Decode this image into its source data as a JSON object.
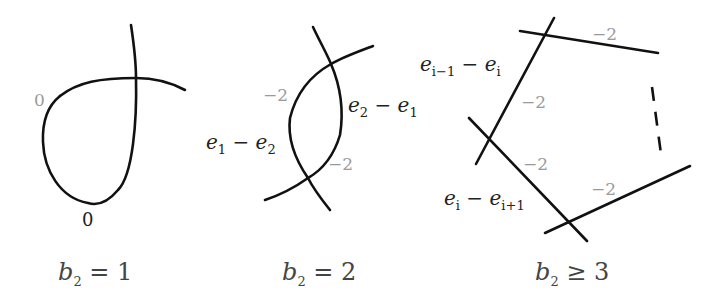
{
  "figure": {
    "panels": [
      {
        "id": "b2-eq-1",
        "caption": {
          "var": "b",
          "sub": "2",
          "rel": " = ",
          "val": "1"
        },
        "labels": [
          {
            "text": "0",
            "tone": "grey"
          },
          {
            "text": "0",
            "tone": "black"
          }
        ]
      },
      {
        "id": "b2-eq-2",
        "caption": {
          "var": "b",
          "sub": "2",
          "rel": " = ",
          "val": "2"
        },
        "labels": [
          {
            "text": "−2",
            "tone": "grey"
          },
          {
            "text": "−2",
            "tone": "grey"
          }
        ],
        "curve_labels": [
          {
            "a": "e",
            "a_sub": "1",
            "op": " − ",
            "b": "e",
            "b_sub": "2"
          },
          {
            "a": "e",
            "a_sub": "2",
            "op": " − ",
            "b": "e",
            "b_sub": "1"
          }
        ]
      },
      {
        "id": "b2-geq-3",
        "caption": {
          "var": "b",
          "sub": "2",
          "rel": " ≥ ",
          "val": "3"
        },
        "labels": [
          {
            "text": "−2",
            "tone": "grey"
          },
          {
            "text": "−2",
            "tone": "grey"
          },
          {
            "text": "−2",
            "tone": "grey"
          },
          {
            "text": "−2",
            "tone": "grey"
          }
        ],
        "curve_labels": [
          {
            "a": "e",
            "a_sub": "i−1",
            "op": " − ",
            "b": "e",
            "b_sub": "i"
          },
          {
            "a": "e",
            "a_sub": "i",
            "op": " − ",
            "b": "e",
            "b_sub": "i+1"
          }
        ]
      }
    ]
  }
}
